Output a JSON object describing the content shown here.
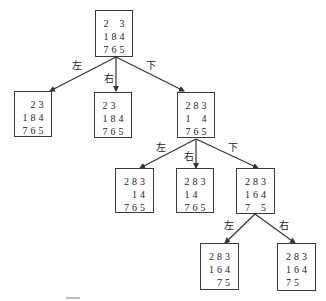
{
  "diagram": {
    "nodes": [
      {
        "id": "root",
        "x": 95,
        "y": 10,
        "w": 38,
        "h": 47,
        "cells": [
          "2",
          "",
          "3",
          "1",
          "8",
          "4",
          "7",
          "6",
          "5"
        ]
      },
      {
        "id": "n1",
        "x": 14,
        "y": 91,
        "w": 38,
        "h": 46,
        "cells": [
          "",
          "2",
          "3",
          "1",
          "8",
          "4",
          "7",
          "6",
          "5"
        ]
      },
      {
        "id": "n2",
        "x": 94,
        "y": 92,
        "w": 38,
        "h": 46,
        "cells": [
          "2",
          "3",
          "",
          "1",
          "8",
          "4",
          "7",
          "6",
          "5"
        ]
      },
      {
        "id": "n3",
        "x": 177,
        "y": 92,
        "w": 38,
        "h": 46,
        "cells": [
          "2",
          "8",
          "3",
          "1",
          "",
          "4",
          "7",
          "6",
          "5"
        ]
      },
      {
        "id": "n4",
        "x": 115,
        "y": 168,
        "w": 39,
        "h": 45,
        "cells": [
          "2",
          "8",
          "3",
          "",
          "1",
          "4",
          "7",
          "6",
          "5"
        ]
      },
      {
        "id": "n5",
        "x": 176,
        "y": 168,
        "w": 38,
        "h": 45,
        "cells": [
          "2",
          "8",
          "3",
          "1",
          "4",
          "",
          "7",
          "6",
          "5"
        ]
      },
      {
        "id": "n6",
        "x": 236,
        "y": 168,
        "w": 39,
        "h": 46,
        "cells": [
          "2",
          "8",
          "3",
          "1",
          "6",
          "4",
          "7",
          "",
          "5"
        ]
      },
      {
        "id": "n7",
        "x": 200,
        "y": 243,
        "w": 39,
        "h": 47,
        "cells": [
          "2",
          "8",
          "3",
          "1",
          "6",
          "4",
          "",
          "7",
          "5"
        ]
      },
      {
        "id": "n8",
        "x": 277,
        "y": 243,
        "w": 39,
        "h": 48,
        "cells": [
          "2",
          "8",
          "3",
          "1",
          "6",
          "4",
          "7",
          "5",
          ""
        ]
      }
    ],
    "edges": [
      {
        "from": "root",
        "to": "n1",
        "label": "左",
        "x1": 116,
        "y1": 57,
        "x2": 50,
        "y2": 91,
        "lx": 72,
        "ly": 61
      },
      {
        "from": "root",
        "to": "n2",
        "label": "右",
        "x1": 116,
        "y1": 57,
        "x2": 116,
        "y2": 91,
        "lx": 104,
        "ly": 74
      },
      {
        "from": "root",
        "to": "n3",
        "label": "下",
        "x1": 116,
        "y1": 57,
        "x2": 184,
        "y2": 91,
        "lx": 146,
        "ly": 61
      },
      {
        "from": "n3",
        "to": "n4",
        "label": "左",
        "x1": 196,
        "y1": 139,
        "x2": 140,
        "y2": 168,
        "lx": 156,
        "ly": 143
      },
      {
        "from": "n3",
        "to": "n5",
        "label": "右",
        "x1": 196,
        "y1": 139,
        "x2": 196,
        "y2": 168,
        "lx": 184,
        "ly": 152
      },
      {
        "from": "n3",
        "to": "n6",
        "label": "下",
        "x1": 196,
        "y1": 139,
        "x2": 258,
        "y2": 168,
        "lx": 228,
        "ly": 143
      },
      {
        "from": "n6",
        "to": "n7",
        "label": "左",
        "x1": 255,
        "y1": 214,
        "x2": 225,
        "y2": 243,
        "lx": 224,
        "ly": 221
      },
      {
        "from": "n6",
        "to": "n8",
        "label": "右",
        "x1": 255,
        "y1": 214,
        "x2": 295,
        "y2": 243,
        "lx": 279,
        "ly": 221
      }
    ],
    "colors": {
      "line": "#333333",
      "border": "#3a3a3a",
      "text": "#222222"
    }
  }
}
